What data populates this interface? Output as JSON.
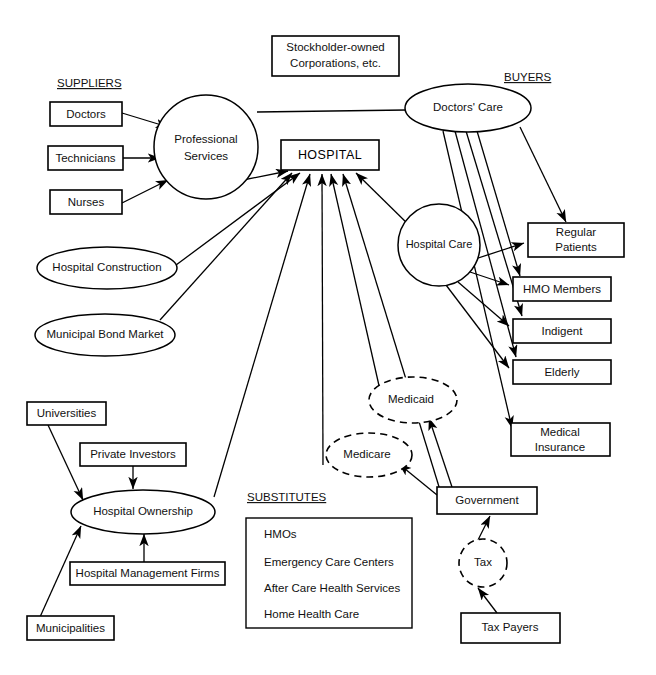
{
  "diagram": {
    "title_sections": {
      "suppliers": "SUPPLIERS",
      "buyers": "BUYERS",
      "substitutes": "SUBSTITUTES"
    },
    "nodes": {
      "doctors": "Doctors",
      "technicians": "Technicians",
      "nurses": "Nurses",
      "professional_services_line1": "Professional",
      "professional_services_line2": "Services",
      "hospital_construction": "Hospital Construction",
      "municipal_bond_market": "Municipal Bond Market",
      "stockholder_line1": "Stockholder-owned",
      "stockholder_line2": "Corporations, etc.",
      "hospital": "HOSPITAL",
      "doctors_care": "Doctors' Care",
      "hospital_care": "Hospital Care",
      "regular_patients_line1": "Regular",
      "regular_patients_line2": "Patients",
      "hmo_members": "HMO Members",
      "indigent": "Indigent",
      "elderly": "Elderly",
      "medical_insurance_line1": "Medical",
      "medical_insurance_line2": "Insurance",
      "medicaid": "Medicaid",
      "medicare": "Medicare",
      "government": "Government",
      "tax": "Tax",
      "tax_payers": "Tax Payers",
      "universities": "Universities",
      "private_investors": "Private Investors",
      "hospital_ownership": "Hospital Ownership",
      "hospital_management_firms": "Hospital Management Firms",
      "municipalities": "Municipalities"
    },
    "substitutes_list": [
      "HMOs",
      "Emergency Care Centers",
      "After Care Health Services",
      "Home Health Care"
    ],
    "colors": {
      "stroke": "#000000",
      "fill": "#ffffff",
      "text": "#111111"
    }
  }
}
